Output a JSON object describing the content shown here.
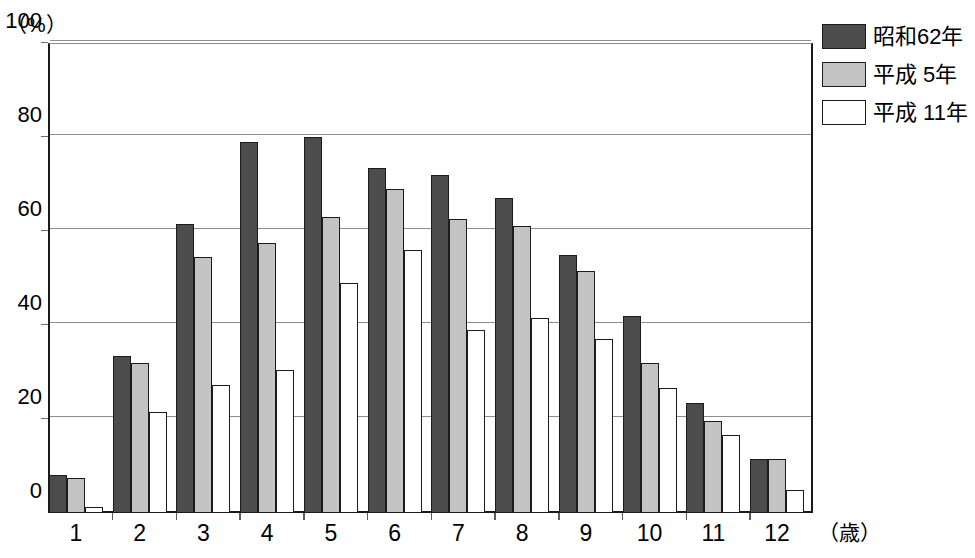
{
  "chart_data": {
    "type": "bar",
    "title": "",
    "subtitle": "",
    "xlabel": "（歳）",
    "ylabel": "（%）",
    "ylim": [
      0,
      100
    ],
    "yticks": [
      0,
      20,
      40,
      60,
      80,
      100
    ],
    "ytick_labels": [
      "0",
      "20",
      "40",
      "60",
      "80",
      "100"
    ],
    "grid": "horizontal",
    "legend_position": "top-right",
    "categories": [
      "1",
      "2",
      "3",
      "4",
      "5",
      "6",
      "7",
      "8",
      "9",
      "10",
      "11",
      "12"
    ],
    "series": [
      {
        "name": "昭和62年",
        "color": "#4c4c4c",
        "values": [
          8,
          33.5,
          61.5,
          79,
          80,
          73.5,
          72,
          67,
          55,
          42,
          23.5,
          11.5
        ]
      },
      {
        "name": "平成 5年",
        "color": "#c3c3c3",
        "values": [
          7.5,
          32,
          54.5,
          57.5,
          63,
          69,
          62.5,
          61,
          51.5,
          32,
          19.5,
          11.5
        ]
      },
      {
        "name": "平成 11年",
        "color": "#ffffff",
        "values": [
          1.3,
          21.5,
          27.3,
          30.5,
          49,
          56,
          39,
          41.5,
          37,
          26.5,
          16.5,
          5
        ]
      }
    ]
  },
  "axes": {
    "y_unit_label": "（%）",
    "x_unit_label": "（歳）"
  },
  "legend": {
    "items": [
      {
        "label": "昭和62年",
        "swatch": "dark-swatch"
      },
      {
        "label": "平成 5年",
        "swatch": "gray-swatch"
      },
      {
        "label": "平成 11年",
        "swatch": "white-swatch"
      }
    ]
  },
  "colors": {
    "series_dark": "#4c4c4c",
    "series_gray": "#c3c3c3",
    "series_white": "#ffffff",
    "axis": "#1c1c1c",
    "grid": "#8d8d8d"
  }
}
